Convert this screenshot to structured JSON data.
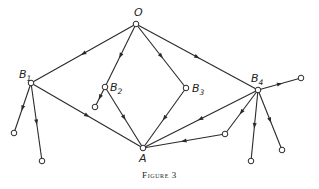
{
  "diagram": {
    "caption": "Figure 3",
    "nodes": [
      {
        "id": "O",
        "label": "O",
        "sub": "",
        "x": 136,
        "y": 24
      },
      {
        "id": "B1",
        "label": "B",
        "sub": "1",
        "x": 31,
        "y": 83
      },
      {
        "id": "B2",
        "label": "B",
        "sub": "2",
        "x": 105,
        "y": 87
      },
      {
        "id": "B3",
        "label": "B",
        "sub": "3",
        "x": 186,
        "y": 88
      },
      {
        "id": "B4",
        "label": "B",
        "sub": "4",
        "x": 258,
        "y": 90
      },
      {
        "id": "A",
        "label": "A",
        "sub": "",
        "x": 143,
        "y": 148
      },
      {
        "id": "L1",
        "label": "",
        "sub": "",
        "x": 14,
        "y": 133
      },
      {
        "id": "L2",
        "label": "",
        "sub": "",
        "x": 42,
        "y": 161
      },
      {
        "id": "L3",
        "label": "",
        "sub": "",
        "x": 95,
        "y": 107
      },
      {
        "id": "L4",
        "label": "",
        "sub": "",
        "x": 301,
        "y": 78
      },
      {
        "id": "L5",
        "label": "",
        "sub": "",
        "x": 225,
        "y": 134
      },
      {
        "id": "L6",
        "label": "",
        "sub": "",
        "x": 251,
        "y": 161
      },
      {
        "id": "L7",
        "label": "",
        "sub": "",
        "x": 282,
        "y": 150
      }
    ],
    "edges": [
      {
        "from": "O",
        "to": "B1"
      },
      {
        "from": "O",
        "to": "B2"
      },
      {
        "from": "O",
        "to": "B3"
      },
      {
        "from": "O",
        "to": "B4"
      },
      {
        "from": "B1",
        "to": "L1"
      },
      {
        "from": "B1",
        "to": "L2"
      },
      {
        "from": "B1",
        "to": "A"
      },
      {
        "from": "B2",
        "to": "L3"
      },
      {
        "from": "B2",
        "to": "A"
      },
      {
        "from": "B3",
        "to": "A"
      },
      {
        "from": "B4",
        "to": "L4"
      },
      {
        "from": "B4",
        "to": "A"
      },
      {
        "from": "B4",
        "to": "L5"
      },
      {
        "from": "L5",
        "to": "A"
      },
      {
        "from": "B4",
        "to": "L6"
      },
      {
        "from": "B4",
        "to": "L7"
      }
    ]
  }
}
